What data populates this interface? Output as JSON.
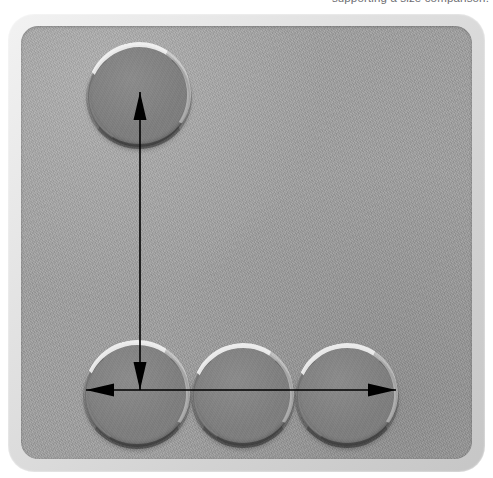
{
  "caption": {
    "text": "supporting a size comparison.",
    "visible_fragment": "comparison.",
    "color": "#6d6d72",
    "position": "top-right, clipped"
  },
  "figure": {
    "name": "disc-arrangement-photo",
    "plate": {
      "rim_color": "#d8d8d8",
      "surface_color": "#a0a0a0",
      "corner_radius_px": 26
    },
    "disc_color": "#7e7e7e",
    "disc_highlight_color": "#ffffff",
    "arrow_color": "#000000",
    "discs": [
      {
        "id": "disc-top",
        "label": "top disc",
        "cx": 139,
        "cy": 96,
        "r": 51
      },
      {
        "id": "disc-bottom-left",
        "label": "bottom-left disc",
        "cx": 137,
        "cy": 395,
        "r": 52
      },
      {
        "id": "disc-bottom-mid",
        "label": "bottom-middle disc",
        "cx": 243,
        "cy": 396,
        "r": 50
      },
      {
        "id": "disc-bottom-right",
        "label": "bottom-right disc",
        "cx": 347,
        "cy": 396,
        "r": 50
      }
    ],
    "arrows": [
      {
        "id": "arrow-vertical",
        "label": "vertical double-headed arrow",
        "orientation": "vertical",
        "double_headed": true,
        "x1": 140,
        "y1": 92,
        "x2": 140,
        "y2": 390
      },
      {
        "id": "arrow-horizontal",
        "label": "horizontal double-headed arrow",
        "orientation": "horizontal",
        "double_headed": true,
        "x1": 86,
        "y1": 390,
        "x2": 396,
        "y2": 390
      }
    ]
  }
}
